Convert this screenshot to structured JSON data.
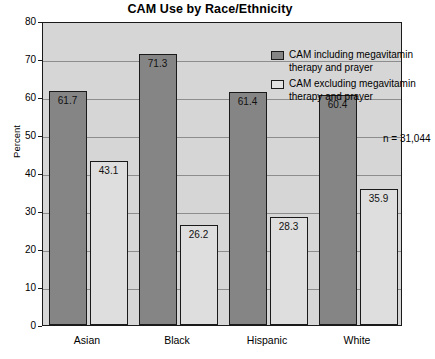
{
  "chart_data": {
    "type": "bar",
    "title": "CAM Use by Race/Ethnicity",
    "xlabel": "",
    "ylabel": "Percent",
    "ylim": [
      0,
      80
    ],
    "ytick_step": 10,
    "yticks": [
      "80",
      "70",
      "60",
      "50",
      "40",
      "30",
      "20",
      "10",
      "0"
    ],
    "grid": true,
    "legend_position": "top-right",
    "categories": [
      "Asian",
      "Black",
      "Hispanic",
      "White"
    ],
    "series": [
      {
        "name": "CAM including megavitamin\ntherapy and prayer",
        "values": [
          61.7,
          71.3,
          61.4,
          60.4
        ],
        "labels": [
          "61.7",
          "71.3",
          "61.4",
          "60.4"
        ],
        "color": "#858585"
      },
      {
        "name": "CAM excluding megavitamin\ntherapy and prayer",
        "values": [
          43.1,
          26.2,
          28.3,
          35.9
        ],
        "labels": [
          "43.1",
          "26.2",
          "28.3",
          "35.9"
        ],
        "color": "#dedede"
      }
    ],
    "annotations": [
      {
        "text": "n = 31,044"
      }
    ]
  },
  "colors": {
    "plot_background": "#d6d6d6",
    "frame": "#1a1a1a",
    "gridline": "#8d8d8d",
    "series_included": "#858585",
    "series_excluded": "#dedede"
  }
}
